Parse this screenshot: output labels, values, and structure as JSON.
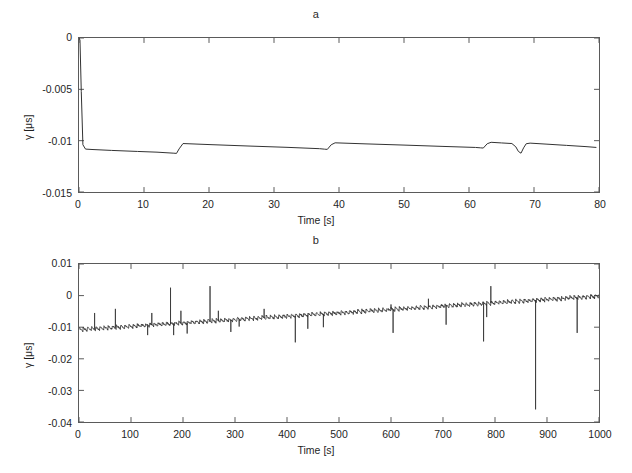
{
  "figure": {
    "background": "#ffffff",
    "line_color": "#333333",
    "axis_color": "#5a5a5a"
  },
  "panels": [
    {
      "title": "a",
      "xlabel": "Time [s]",
      "ylabel": "γ [μs]",
      "xticks": [
        "0",
        "10",
        "20",
        "30",
        "40",
        "50",
        "60",
        "70",
        "80"
      ],
      "yticks": [
        "0",
        "-0.005",
        "-0.01",
        "-0.015"
      ]
    },
    {
      "title": "b",
      "xlabel": "Time [s]",
      "ylabel": "γ [μs]",
      "xticks": [
        "0",
        "100",
        "200",
        "300",
        "400",
        "500",
        "600",
        "700",
        "800",
        "900",
        "1000"
      ],
      "yticks": [
        "0.01",
        "0",
        "-0.01",
        "-0.02",
        "-0.03",
        "-0.04"
      ]
    }
  ],
  "chart_data": [
    {
      "type": "line",
      "title": "a",
      "xlabel": "Time [s]",
      "ylabel": "γ [μs]",
      "xlim": [
        0,
        80
      ],
      "ylim": [
        -0.015,
        0
      ],
      "xticks": [
        0,
        10,
        20,
        30,
        40,
        50,
        60,
        70,
        80
      ],
      "yticks": [
        0,
        -0.005,
        -0.01,
        -0.015
      ],
      "grid": false,
      "legend": null,
      "series": [
        {
          "name": "gamma offset (80 s window)",
          "color": "#333333",
          "comment": "Initial step from 0 down to ~-0.0108 us within first 0.6 s, then slow negative drift with periodic upward resync jumps (sawtooth) and one sharp downward notch near t=68 s.",
          "x": [
            0,
            0.15,
            0.35,
            0.6,
            1.0,
            2.0,
            5.0,
            9.0,
            12.0,
            14.6,
            15.0,
            15.4,
            16.0,
            20.0,
            26.0,
            32.0,
            37.0,
            37.8,
            38.2,
            38.8,
            39.4,
            44.0,
            50.0,
            56.0,
            61.0,
            61.8,
            62.2,
            62.8,
            63.4,
            65.0,
            66.6,
            67.2,
            67.6,
            68.0,
            68.4,
            68.8,
            69.4,
            72.0,
            75.0,
            78.0,
            79.6
          ],
          "y": [
            0.0,
            -0.0002,
            -0.0052,
            -0.0104,
            -0.01082,
            -0.01086,
            -0.01095,
            -0.01105,
            -0.01112,
            -0.01122,
            -0.01124,
            -0.0108,
            -0.01028,
            -0.01038,
            -0.01052,
            -0.01065,
            -0.01078,
            -0.01083,
            -0.01085,
            -0.0104,
            -0.01021,
            -0.01031,
            -0.01043,
            -0.01056,
            -0.01066,
            -0.0107,
            -0.01072,
            -0.0103,
            -0.01016,
            -0.01022,
            -0.01028,
            -0.0106,
            -0.01105,
            -0.01122,
            -0.0107,
            -0.0103,
            -0.01024,
            -0.01034,
            -0.01046,
            -0.01058,
            -0.01066
          ]
        }
      ]
    },
    {
      "type": "line",
      "title": "b",
      "xlabel": "Time [s]",
      "ylabel": "γ [μs]",
      "xlim": [
        0,
        1000
      ],
      "ylim": [
        -0.04,
        0.01
      ],
      "xticks": [
        0,
        100,
        200,
        300,
        400,
        500,
        600,
        700,
        800,
        900,
        1000
      ],
      "yticks": [
        0.01,
        0,
        -0.01,
        -0.02,
        -0.03,
        -0.04
      ],
      "grid": false,
      "legend": null,
      "series": [
        {
          "name": "gamma offset trend (1000 s window)",
          "color": "#333333",
          "comment": "Near-linear upward trend from about -0.0108 us at t=0 to about -0.0002 us at t=1000, with dense small sawtooth ripple plus sparse large positive and negative outlier spikes.",
          "trend_x": [
            0,
            1000
          ],
          "trend_y": [
            -0.0108,
            -0.0002
          ],
          "ripple_amplitude": 0.0006,
          "ripple_period_s": 8,
          "outlier_spikes": [
            {
              "x": 30,
              "y": -0.0055
            },
            {
              "x": 70,
              "y": -0.0042
            },
            {
              "x": 132,
              "y": -0.0125
            },
            {
              "x": 140,
              "y": -0.0055
            },
            {
              "x": 176,
              "y": 0.0025
            },
            {
              "x": 182,
              "y": -0.0125
            },
            {
              "x": 196,
              "y": -0.0048
            },
            {
              "x": 208,
              "y": -0.012
            },
            {
              "x": 252,
              "y": 0.003
            },
            {
              "x": 268,
              "y": -0.0048
            },
            {
              "x": 292,
              "y": -0.0115
            },
            {
              "x": 308,
              "y": -0.0098
            },
            {
              "x": 356,
              "y": -0.0042
            },
            {
              "x": 416,
              "y": -0.0148
            },
            {
              "x": 440,
              "y": -0.0105
            },
            {
              "x": 470,
              "y": -0.01
            },
            {
              "x": 600,
              "y": -0.0028
            },
            {
              "x": 604,
              "y": -0.0118
            },
            {
              "x": 672,
              "y": -0.001
            },
            {
              "x": 706,
              "y": -0.0092
            },
            {
              "x": 778,
              "y": -0.0145
            },
            {
              "x": 784,
              "y": -0.0068
            },
            {
              "x": 792,
              "y": 0.003
            },
            {
              "x": 878,
              "y": -0.036
            },
            {
              "x": 958,
              "y": -0.0118
            }
          ]
        }
      ]
    }
  ]
}
